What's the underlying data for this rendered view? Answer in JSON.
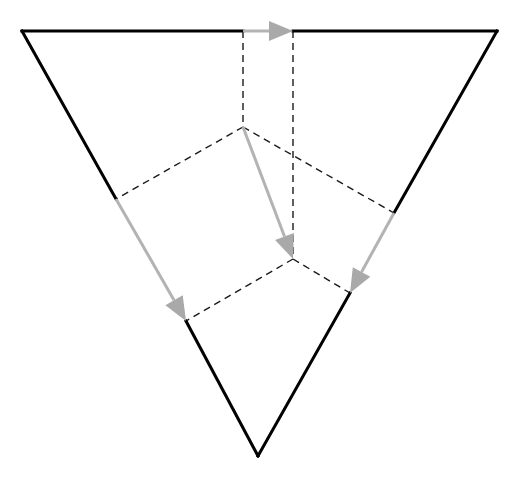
{
  "diagram": {
    "type": "folding-diagram",
    "colors": {
      "background": "#ffffff",
      "solid_edge": "#000000",
      "dashed_fold": "#1a1a1a",
      "arrow": "#a9a9a9"
    },
    "solid_edges": [
      {
        "id": "top-left-edge",
        "points": [
          [
            22,
            31
          ],
          [
            243,
            31
          ]
        ]
      },
      {
        "id": "left-outer-edge",
        "points": [
          [
            22,
            31
          ],
          [
            116,
            199
          ]
        ]
      },
      {
        "id": "top-right-edge",
        "points": [
          [
            293,
            31
          ],
          [
            497,
            31
          ]
        ]
      },
      {
        "id": "right-outer-edge",
        "points": [
          [
            497,
            31
          ],
          [
            394,
            213
          ]
        ]
      },
      {
        "id": "bottom-left-edge",
        "points": [
          [
            186,
            321
          ],
          [
            258,
            456
          ]
        ]
      },
      {
        "id": "bottom-right-edge",
        "points": [
          [
            350,
            293
          ],
          [
            258,
            456
          ]
        ]
      }
    ],
    "dashed_folds": [
      {
        "id": "fold-left-vertical",
        "points": [
          [
            243,
            31
          ],
          [
            243,
            127
          ]
        ]
      },
      {
        "id": "fold-left-diagonal",
        "points": [
          [
            243,
            127
          ],
          [
            116,
            199
          ]
        ]
      },
      {
        "id": "fold-upper-right",
        "points": [
          [
            243,
            127
          ],
          [
            394,
            213
          ]
        ]
      },
      {
        "id": "fold-right-vertical",
        "points": [
          [
            293,
            31
          ],
          [
            293,
            259
          ]
        ]
      },
      {
        "id": "fold-lower-left",
        "points": [
          [
            293,
            259
          ],
          [
            186,
            321
          ]
        ]
      },
      {
        "id": "fold-lower-right",
        "points": [
          [
            293,
            259
          ],
          [
            350,
            293
          ]
        ]
      }
    ],
    "arrows": [
      {
        "id": "arrow-top",
        "from": [
          243,
          31
        ],
        "to": [
          293,
          31
        ]
      },
      {
        "id": "arrow-center",
        "from": [
          243,
          127
        ],
        "to": [
          293,
          259
        ]
      },
      {
        "id": "arrow-left",
        "from": [
          116,
          199
        ],
        "to": [
          186,
          321
        ]
      },
      {
        "id": "arrow-right",
        "from": [
          394,
          213
        ],
        "to": [
          350,
          293
        ]
      }
    ]
  }
}
